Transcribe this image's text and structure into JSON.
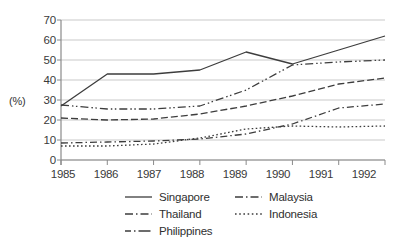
{
  "chart_data": {
    "type": "line",
    "title": "",
    "xlabel": "",
    "ylabel": "(%)",
    "categories": [
      "1985",
      "1986",
      "1987",
      "1988",
      "1989",
      "1990",
      "1991",
      "1992"
    ],
    "x": [
      1985,
      1986,
      1987,
      1988,
      1989,
      1990,
      1991,
      1992
    ],
    "ylim": [
      0,
      70
    ],
    "yticks": [
      0,
      10,
      20,
      30,
      40,
      50,
      60,
      70
    ],
    "xlim": [
      1985,
      1992
    ],
    "grid": "horizontal",
    "legend_position": "bottom",
    "series": [
      {
        "name": "Singapore",
        "style": "solid",
        "values": [
          27,
          43,
          43,
          45,
          54,
          48,
          55,
          62
        ]
      },
      {
        "name": "Malaysia",
        "style": "dash-dot-dot",
        "values": [
          27.5,
          25.5,
          25.5,
          27,
          35,
          47.5,
          49,
          50
        ]
      },
      {
        "name": "Thailand",
        "style": "dash",
        "values": [
          21,
          20,
          20.5,
          23,
          27,
          32,
          38,
          41
        ]
      },
      {
        "name": "Philippines",
        "style": "dash-dot",
        "values": [
          8.5,
          9,
          9.5,
          10.5,
          13,
          18,
          26,
          28
        ]
      },
      {
        "name": "Indonesia",
        "style": "dotted",
        "values": [
          7,
          7,
          8,
          11,
          15.5,
          17,
          16.5,
          17
        ]
      }
    ]
  },
  "axes": {
    "y_tick_labels": [
      "70",
      "60",
      "50",
      "40",
      "30",
      "20",
      "10",
      "0"
    ],
    "y_axis_title": "(%)",
    "x_tick_labels": [
      "1985",
      "1986",
      "1987",
      "1988",
      "1989",
      "1990",
      "1991",
      "1992"
    ]
  },
  "legend": {
    "left_column": [
      {
        "label": "Singapore",
        "style": "solid"
      },
      {
        "label": "Thailand",
        "style": "dash"
      },
      {
        "label": "Philippines",
        "style": "dash-dot"
      }
    ],
    "right_column": [
      {
        "label": "Malaysia",
        "style": "dash-dot-dot"
      },
      {
        "label": "Indonesia",
        "style": "dotted"
      }
    ]
  },
  "colors": {
    "line": "#3d3d3d",
    "grid": "#c9c9c9",
    "axis": "#8a8a8a",
    "text": "#333333",
    "background": "#ffffff"
  }
}
